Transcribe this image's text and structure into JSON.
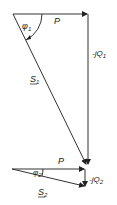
{
  "diagram": {
    "type": "power-triangles",
    "colors": {
      "line": "#333333",
      "text": "#222222",
      "background": "#ffffff"
    },
    "triangle1": {
      "real_power": {
        "label": "P"
      },
      "reactive_power": {
        "label": "-jQ",
        "subscript": "1"
      },
      "apparent_power": {
        "label": "S",
        "subscript": "1",
        "underline": true
      },
      "angle": {
        "label": "φ",
        "subscript": "1"
      }
    },
    "triangle2": {
      "real_power": {
        "label": "P"
      },
      "reactive_power": {
        "label": "-jQ",
        "subscript": "2"
      },
      "apparent_power": {
        "label": "S",
        "subscript": "2",
        "underline": true
      },
      "angle": {
        "label": "φ",
        "subscript": "2"
      }
    }
  }
}
